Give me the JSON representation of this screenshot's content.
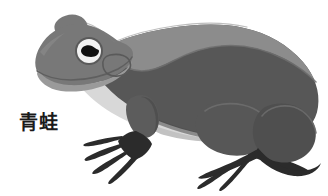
{
  "illustration": {
    "title": "frog-illustration",
    "subject": "frog",
    "caption": "青蛙",
    "caption_language": "zh",
    "caption_color": "#1a1a1a",
    "background_color": "#ffffff",
    "style": "flat-grayscale-clipart",
    "canvas": {
      "width": 328,
      "height": 196
    },
    "palette": {
      "outline": "#4a4a4a",
      "dorsal_band": "#8c8c8c",
      "body_dark": "#575757",
      "body_mid": "#6e6e6e",
      "head_mid": "#787878",
      "jaw_light": "#9a9a9a",
      "belly_light": "#d8d8d8",
      "belly_shadow": "#c2c2c2",
      "limb_dark": "#4f4f4f",
      "foot_black": "#2b2b2b",
      "eye_white": "#f2f2f2",
      "eye_pupil": "#111111",
      "eye_ring": "#5a5a5a"
    },
    "parts": [
      {
        "name": "head",
        "label": "head"
      },
      {
        "name": "head-bump",
        "label": "head bump"
      },
      {
        "name": "eye",
        "label": "eye"
      },
      {
        "name": "pupil",
        "label": "pupil"
      },
      {
        "name": "tympanum",
        "label": "tympanum"
      },
      {
        "name": "mouth",
        "label": "mouth line"
      },
      {
        "name": "dorsal-band",
        "label": "dorsal band"
      },
      {
        "name": "body",
        "label": "body"
      },
      {
        "name": "belly",
        "label": "belly"
      },
      {
        "name": "front-leg",
        "label": "front leg"
      },
      {
        "name": "front-foot",
        "label": "front foot"
      },
      {
        "name": "hind-thigh",
        "label": "hind thigh"
      },
      {
        "name": "hind-shin",
        "label": "hind shin"
      },
      {
        "name": "hind-foot",
        "label": "hind foot"
      }
    ]
  }
}
